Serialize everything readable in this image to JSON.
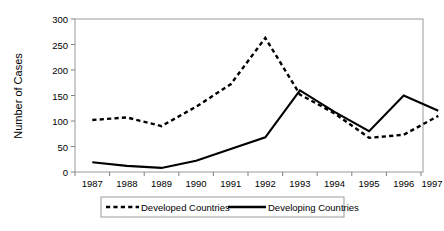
{
  "chart_data": {
    "type": "line",
    "title": "",
    "subtitle": "",
    "xlabel": "",
    "ylabel": "Number of Cases",
    "categories": [
      "1987",
      "1988",
      "1989",
      "1990",
      "1991",
      "1992",
      "1993",
      "1994",
      "1995",
      "1996",
      "1997"
    ],
    "ylim": [
      0,
      300
    ],
    "yticks": [
      "0",
      "50",
      "100",
      "150",
      "200",
      "250",
      "300"
    ],
    "ytick_values": [
      0,
      50,
      100,
      150,
      200,
      250,
      300
    ],
    "grid": false,
    "legend_position": "bottom",
    "series": [
      {
        "name": "Developed Countries",
        "style": "dashed",
        "color": "#000000",
        "values": [
          102,
          107,
          90,
          128,
          172,
          263,
          152,
          115,
          67,
          73,
          110
        ]
      },
      {
        "name": "Developing Countries",
        "style": "solid",
        "color": "#000000",
        "values": [
          19,
          12,
          8,
          22,
          45,
          68,
          160,
          118,
          80,
          150,
          120
        ]
      }
    ]
  },
  "legend": {
    "entries": [
      {
        "label": "Developed Countries",
        "style": "dashed"
      },
      {
        "label": "Developing Countries",
        "style": "solid"
      }
    ]
  }
}
